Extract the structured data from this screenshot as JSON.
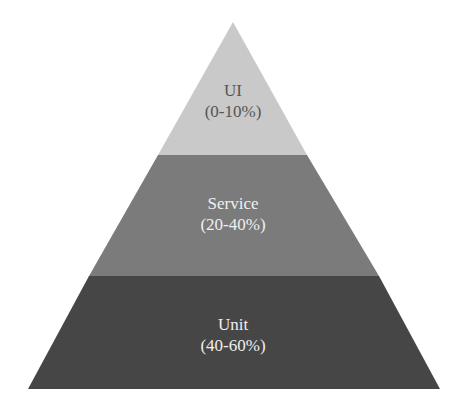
{
  "diagram": {
    "type": "pyramid",
    "layers": [
      {
        "name": "UI",
        "range": "(0-10%)",
        "color": "#c9c9c9",
        "text_color": "#555555"
      },
      {
        "name": "Service",
        "range": "(20-40%)",
        "color": "#7b7b7b",
        "text_color": "#f0f0f0"
      },
      {
        "name": "Unit",
        "range": "(40-60%)",
        "color": "#464646",
        "text_color": "#f0f0f0"
      }
    ]
  }
}
